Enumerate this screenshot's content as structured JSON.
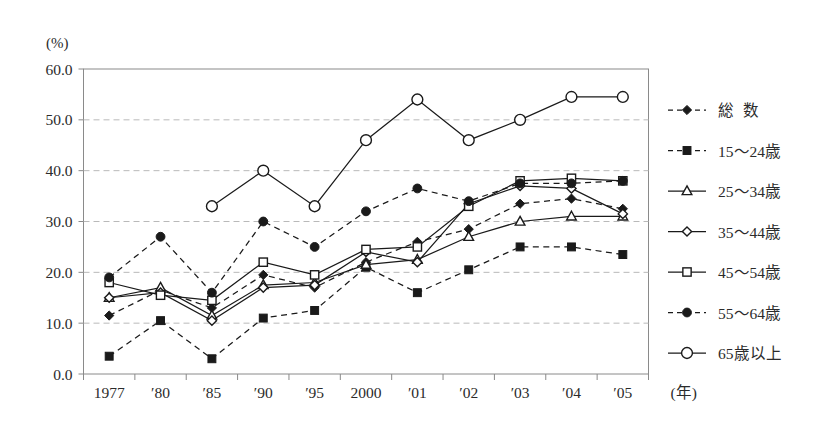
{
  "chart_data": {
    "type": "line",
    "title": "",
    "subtitle": "",
    "xlabel": "(年)",
    "ylabel": "(%)",
    "x": [
      "1977",
      "′80",
      "′85",
      "′90",
      "′95",
      "2000",
      "′01",
      "′02",
      "′03",
      "′04",
      "′05"
    ],
    "categories": [
      "1977",
      "′80",
      "′85",
      "′90",
      "′95",
      "2000",
      "′01",
      "′02",
      "′03",
      "′04",
      "′05"
    ],
    "ylim": [
      0,
      60
    ],
    "yticks": [
      0,
      10,
      20,
      30,
      40,
      50,
      60
    ],
    "ytick_labels": [
      "0.0",
      "10.0",
      "20.0",
      "30.0",
      "40.0",
      "50.0",
      "60.0"
    ],
    "grid": "horizontal-dashed",
    "legend_position": "right",
    "series": [
      {
        "name": "総　　数",
        "marker": "filled-diamond",
        "line": "dashed",
        "values": [
          11.5,
          16.5,
          13.0,
          19.5,
          17.0,
          22.0,
          26.0,
          28.5,
          33.5,
          34.5,
          32.5
        ]
      },
      {
        "name": "15～24歳",
        "marker": "filled-square",
        "line": "dashed",
        "values": [
          3.5,
          10.5,
          3.0,
          11.0,
          12.5,
          21.0,
          16.0,
          20.5,
          25.0,
          25.0,
          23.5
        ]
      },
      {
        "name": "25～34歳",
        "marker": "open-triangle",
        "line": "solid",
        "values": [
          15.0,
          17.0,
          11.5,
          17.5,
          18.0,
          21.5,
          22.5,
          27.0,
          30.0,
          31.0,
          31.0
        ]
      },
      {
        "name": "35～44歳",
        "marker": "open-diamond",
        "line": "solid",
        "values": [
          15.0,
          16.0,
          10.5,
          17.0,
          17.5,
          24.0,
          22.0,
          33.5,
          37.0,
          36.5,
          31.5
        ]
      },
      {
        "name": "45～54歳",
        "marker": "open-square",
        "line": "solid",
        "values": [
          18.0,
          15.5,
          14.5,
          22.0,
          19.5,
          24.5,
          25.0,
          33.0,
          38.0,
          38.5,
          38.0
        ]
      },
      {
        "name": "55～64歳",
        "marker": "filled-circle",
        "line": "dashed",
        "values": [
          19.0,
          27.0,
          16.0,
          30.0,
          25.0,
          32.0,
          36.5,
          34.0,
          37.5,
          37.5,
          38.0
        ]
      },
      {
        "name": "65歳以上",
        "marker": "open-circle",
        "line": "solid",
        "values": [
          null,
          null,
          33.0,
          40.0,
          33.0,
          46.0,
          54.0,
          46.0,
          50.0,
          54.5,
          54.5
        ]
      }
    ]
  },
  "colors": {
    "ink": "#1a1a1a",
    "axis": "#8a8a8a",
    "grid": "#b9b9b9",
    "background": "#ffffff"
  }
}
